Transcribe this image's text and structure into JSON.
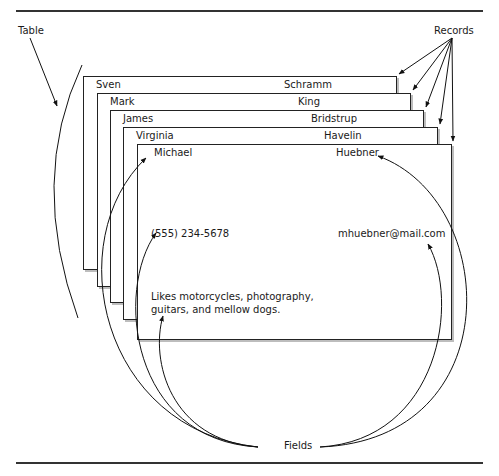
{
  "diagram": {
    "labels": {
      "table": "Table",
      "records": "Records",
      "fields": "Fields"
    },
    "records": [
      {
        "first_name": "Sven",
        "last_name": "Schramm"
      },
      {
        "first_name": "Mark",
        "last_name": "King"
      },
      {
        "first_name": "James",
        "last_name": "Bridstrup"
      },
      {
        "first_name": "Virginia",
        "last_name": "Havelin"
      },
      {
        "first_name": "Michael",
        "last_name": "Huebner"
      }
    ],
    "front_record": {
      "first_name": "Michael",
      "last_name": "Huebner",
      "phone": "(555) 234-5678",
      "email": "mhuebner@mail.com",
      "notes": "Likes motorcycles, photography, guitars, and mellow dogs."
    },
    "colors": {
      "line": "#222222",
      "shadow": "#bdbdbd",
      "background": "#ffffff"
    }
  }
}
